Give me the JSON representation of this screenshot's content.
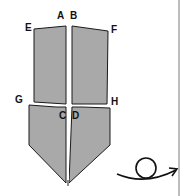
{
  "diagram": {
    "type": "origami-fold-step",
    "labels": {
      "A": "A",
      "B": "B",
      "C": "C",
      "D": "D",
      "E": "E",
      "F": "F",
      "G": "G",
      "H": "H"
    },
    "symbols": [
      "turn-over-arrow"
    ],
    "colors": {
      "paper": "#a9a9a9",
      "outline": "#1a1a1a",
      "divider": "#7a7a7a",
      "background": "#ffffff"
    }
  }
}
